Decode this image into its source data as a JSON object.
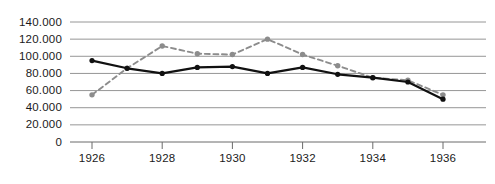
{
  "chart_data": {
    "type": "line",
    "title": "",
    "xlabel": "",
    "ylabel": "",
    "x": [
      1926,
      1927,
      1928,
      1929,
      1930,
      1931,
      1932,
      1933,
      1934,
      1935,
      1936
    ],
    "xlim": [
      1926,
      1936
    ],
    "ylim": [
      0,
      140000
    ],
    "grid": true,
    "legend": "none",
    "x_tick_labels": [
      "1926",
      "1928",
      "1930",
      "1932",
      "1934",
      "1936"
    ],
    "x_tick_values": [
      1926,
      1928,
      1930,
      1932,
      1934,
      1936
    ],
    "y_tick_labels": [
      "140.000",
      "120.000",
      "100.000",
      "80.000",
      "60.000",
      "40.000",
      "20.000",
      "0"
    ],
    "y_tick_values": [
      140000,
      120000,
      100000,
      80000,
      60000,
      40000,
      20000,
      0
    ],
    "series": [
      {
        "name": "solid-black-series",
        "style": "solid",
        "color": "#111111",
        "marker": "circle",
        "values": [
          95000,
          86000,
          80000,
          87000,
          88000,
          80000,
          87000,
          79000,
          75000,
          70000,
          50000
        ]
      },
      {
        "name": "dashed-gray-series",
        "style": "dashed",
        "color": "#8c8c8c",
        "marker": "circle",
        "values": [
          55000,
          86000,
          112000,
          103000,
          102000,
          120000,
          102000,
          89000,
          75000,
          72000,
          55000
        ]
      }
    ]
  },
  "colors": {
    "background": "#ffffff",
    "grid": "#8a8a8a",
    "axis": "#6b6b6b",
    "series_solid": "#111111",
    "series_dashed": "#8c8c8c",
    "text": "#1a1a1a"
  }
}
